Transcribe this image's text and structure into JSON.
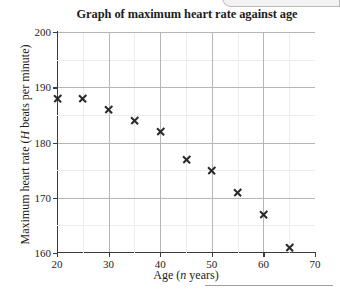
{
  "chart_data": {
    "type": "scatter",
    "title": "Graph of maximum heart rate against age",
    "xlabel": "Age (n years)",
    "xlabel_parts": {
      "before": "Age (",
      "italic": "n",
      "after": " years)"
    },
    "ylabel": "Maximum heart rate (H beats per minute)",
    "ylabel_parts": {
      "before": "Maximum heart rate (",
      "italic": "H",
      "after": " beats per minute)"
    },
    "xlim": [
      20,
      70
    ],
    "ylim": [
      160,
      200
    ],
    "x_ticks": [
      20,
      30,
      40,
      50,
      60,
      70
    ],
    "x_tick_labels": [
      "20",
      "30",
      "40",
      "50",
      "60",
      "70"
    ],
    "x_minor_ticks": [
      25,
      35,
      45,
      55,
      65
    ],
    "y_ticks": [
      160,
      170,
      180,
      190,
      200
    ],
    "y_tick_labels": [
      "160",
      "170",
      "180",
      "190",
      "200"
    ],
    "y_minor_ticks": [
      165,
      175,
      185,
      195
    ],
    "grid": true,
    "legend": "none",
    "marker": "cross",
    "x": [
      20,
      25,
      30,
      35,
      40,
      45,
      50,
      55,
      60,
      65
    ],
    "values": [
      188,
      188,
      186,
      184,
      182,
      177,
      175,
      171,
      167,
      161
    ],
    "points": [
      {
        "x": 20,
        "y": 188
      },
      {
        "x": 25,
        "y": 188
      },
      {
        "x": 30,
        "y": 186
      },
      {
        "x": 35,
        "y": 184
      },
      {
        "x": 40,
        "y": 182
      },
      {
        "x": 45,
        "y": 177
      },
      {
        "x": 50,
        "y": 175
      },
      {
        "x": 55,
        "y": 171
      },
      {
        "x": 60,
        "y": 167
      },
      {
        "x": 65,
        "y": 161
      }
    ],
    "colors": {
      "marker": "#2a2a2a",
      "axis": "#3a3a3a",
      "gridline_major": "#b6b6b6",
      "gridline_minor": "#ededed",
      "background": "#ffffff",
      "text": "#1c1c1c"
    }
  }
}
